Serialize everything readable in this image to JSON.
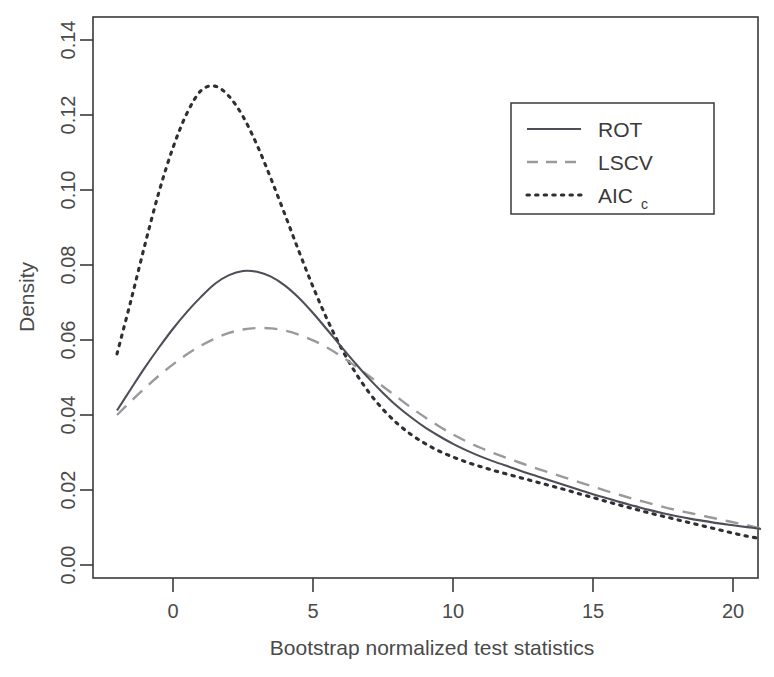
{
  "chart_data": {
    "type": "line",
    "title": "",
    "xlabel": "Bootstrap normalized test statistics",
    "ylabel": "Density",
    "xlim": [
      -2.85,
      20.9
    ],
    "ylim": [
      0.0,
      0.1467
    ],
    "xticks": [
      0,
      5,
      10,
      15,
      20
    ],
    "xtick_labels": [
      "0",
      "5",
      "10",
      "15",
      "20"
    ],
    "yticks": [
      0.0,
      0.02,
      0.04,
      0.06,
      0.08,
      0.1,
      0.12,
      0.14
    ],
    "ytick_labels": [
      "0.00",
      "0.02",
      "0.04",
      "0.06",
      "0.08",
      "0.10",
      "0.12",
      "0.14"
    ],
    "grid": false,
    "legend_position": "top-right",
    "x": [
      -2,
      -1.5,
      -1,
      -0.5,
      0,
      0.5,
      1,
      1.5,
      2,
      2.5,
      3,
      3.5,
      4,
      4.5,
      5,
      5.5,
      6,
      6.5,
      7,
      7.5,
      8,
      8.5,
      9,
      9.5,
      10,
      10.5,
      11,
      11.5,
      12,
      12.5,
      13,
      13.5,
      14,
      14.5,
      15,
      15.5,
      16,
      16.5,
      17,
      17.5,
      18,
      18.5,
      19,
      19.5,
      20,
      20.5,
      21
    ],
    "series": [
      {
        "name": "ROT",
        "style": "solid",
        "color": "#4e4e58",
        "peak_x": 1.68,
        "peak_y": 0.0785,
        "values": [
          0.0412,
          0.047,
          0.0527,
          0.058,
          0.063,
          0.0675,
          0.0715,
          0.075,
          0.0773,
          0.0784,
          0.0782,
          0.0769,
          0.0745,
          0.0712,
          0.0672,
          0.0628,
          0.0583,
          0.0539,
          0.0497,
          0.0459,
          0.0424,
          0.0394,
          0.0367,
          0.0344,
          0.0323,
          0.0305,
          0.0289,
          0.0275,
          0.0262,
          0.0249,
          0.0237,
          0.0225,
          0.0213,
          0.0201,
          0.0189,
          0.0178,
          0.0167,
          0.0157,
          0.0147,
          0.0138,
          0.013,
          0.0123,
          0.0117,
          0.0111,
          0.0106,
          0.0101,
          0.0096
        ]
      },
      {
        "name": "LSCV",
        "style": "dashed",
        "color": "#9a9a9a",
        "peak_x": 2.14,
        "peak_y": 0.0632,
        "values": [
          0.04,
          0.0437,
          0.0472,
          0.0505,
          0.0535,
          0.0562,
          0.0585,
          0.0604,
          0.0619,
          0.0628,
          0.0632,
          0.0631,
          0.0625,
          0.0614,
          0.0599,
          0.058,
          0.0557,
          0.0531,
          0.0504,
          0.0476,
          0.0448,
          0.042,
          0.0394,
          0.037,
          0.0348,
          0.0329,
          0.0312,
          0.0297,
          0.0283,
          0.027,
          0.0257,
          0.0245,
          0.0233,
          0.0221,
          0.0209,
          0.0197,
          0.0186,
          0.0175,
          0.0165,
          0.0155,
          0.0146,
          0.0138,
          0.013,
          0.0122,
          0.0114,
          0.0106,
          0.0097
        ]
      },
      {
        "name": "AICc",
        "style": "dotted",
        "color": "#2f2f33",
        "peak_x": 1.07,
        "peak_y": 0.1277,
        "values": [
          0.0563,
          0.0706,
          0.0855,
          0.0995,
          0.1113,
          0.1205,
          0.1265,
          0.1277,
          0.125,
          0.1196,
          0.112,
          0.103,
          0.0934,
          0.0836,
          0.0742,
          0.0656,
          0.058,
          0.0515,
          0.046,
          0.0415,
          0.0378,
          0.0348,
          0.0324,
          0.0304,
          0.0288,
          0.0274,
          0.0262,
          0.0251,
          0.0241,
          0.0231,
          0.0221,
          0.0211,
          0.0201,
          0.019,
          0.018,
          0.0169,
          0.0159,
          0.0149,
          0.0139,
          0.013,
          0.0121,
          0.0112,
          0.0103,
          0.0094,
          0.0085,
          0.0077,
          0.007
        ]
      }
    ]
  },
  "legend": {
    "entries": [
      {
        "label": "ROT",
        "sub": ""
      },
      {
        "label": "LSCV",
        "sub": ""
      },
      {
        "label": "AIC",
        "sub": "c"
      }
    ]
  }
}
